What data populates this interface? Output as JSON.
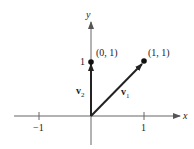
{
  "diagram": {
    "colors": {
      "axis": "#555555",
      "vector": "#222222",
      "text": "#222222",
      "background": "#ffffff"
    },
    "axes": {
      "x_label": "x",
      "y_label": "y",
      "x_ticks": [
        {
          "value": -1,
          "label": "−1"
        },
        {
          "value": 1,
          "label": "1"
        }
      ],
      "y_ticks": [
        {
          "value": 1,
          "label": "1"
        }
      ]
    },
    "points": [
      {
        "name": "p01",
        "coords": [
          0,
          1
        ],
        "label": "(0, 1)"
      },
      {
        "name": "p11",
        "coords": [
          1,
          1
        ],
        "label": "(1, 1)"
      }
    ],
    "vectors": [
      {
        "name": "v1",
        "from": [
          0,
          0
        ],
        "to": [
          1,
          1
        ],
        "label_base": "v",
        "label_sub": "1"
      },
      {
        "name": "v2",
        "from": [
          0,
          0
        ],
        "to": [
          0,
          1
        ],
        "label_base": "v",
        "label_sub": "2"
      }
    ]
  }
}
